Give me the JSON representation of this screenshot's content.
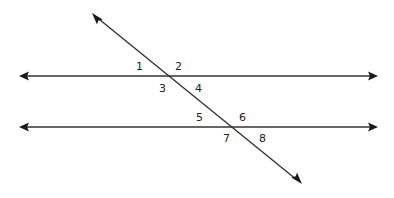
{
  "diagram": {
    "colors": {
      "line": "#333333",
      "arrowhead": "#1a1a1a",
      "label": "#222222",
      "background": "#ffffff"
    },
    "lines": [
      {
        "id": "parallel-top",
        "x1": 20,
        "y1": 76,
        "x2": 377,
        "y2": 76,
        "arrows": "both"
      },
      {
        "id": "parallel-bottom",
        "x1": 20,
        "y1": 127,
        "x2": 377,
        "y2": 127,
        "arrows": "both"
      },
      {
        "id": "transversal",
        "x1": 93,
        "y1": 14,
        "x2": 301,
        "y2": 183,
        "arrows": "both"
      }
    ],
    "intersections": [
      {
        "id": "top",
        "x": 168,
        "y": 76
      },
      {
        "id": "bottom",
        "x": 231,
        "y": 127
      }
    ],
    "angle_labels": [
      {
        "text": "1",
        "x": 138,
        "y": 70
      },
      {
        "text": "2",
        "x": 175,
        "y": 70
      },
      {
        "text": "3",
        "x": 159,
        "y": 92
      },
      {
        "text": "4",
        "x": 195,
        "y": 92
      },
      {
        "text": "5",
        "x": 196,
        "y": 121
      },
      {
        "text": "6",
        "x": 239,
        "y": 121
      },
      {
        "text": "7",
        "x": 223,
        "y": 142
      },
      {
        "text": "8",
        "x": 259,
        "y": 142
      }
    ]
  }
}
